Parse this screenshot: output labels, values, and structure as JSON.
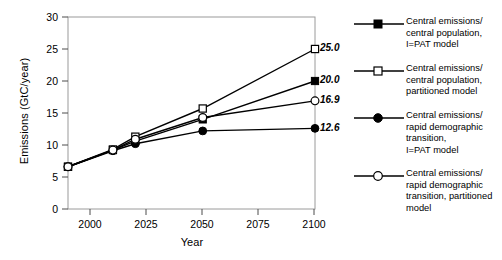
{
  "chart_data": {
    "type": "line",
    "title": "",
    "xlabel": "Year",
    "ylabel": "Emissions (GtC/year)",
    "xlim": [
      1990,
      2100
    ],
    "ylim": [
      0,
      30
    ],
    "xticks": [
      2000,
      2025,
      2050,
      2075,
      2100
    ],
    "yticks": [
      0,
      5,
      10,
      15,
      20,
      25,
      30
    ],
    "grid": false,
    "legend_position": "right",
    "x": [
      1990,
      2010,
      2020,
      2050,
      2100
    ],
    "series": [
      {
        "name": "Central emissions/\ncentral population,\nI=PAT model",
        "marker": "filled-square",
        "values": [
          6.6,
          9.2,
          10.6,
          14.0,
          20.0
        ],
        "endpoint_label": "20.0"
      },
      {
        "name": "Central emissions/\ncentral population,\npartitioned model",
        "marker": "open-square",
        "values": [
          6.6,
          9.3,
          11.3,
          15.7,
          25.0
        ],
        "endpoint_label": "25.0"
      },
      {
        "name": "Central emissions/\nrapid demographic\ntransition,\nI=PAT model",
        "marker": "filled-circle",
        "values": [
          6.6,
          9.1,
          10.2,
          12.2,
          12.6
        ],
        "endpoint_label": "12.6"
      },
      {
        "name": "Central emissions/\nrapid demographic\ntransition, partitioned\nmodel",
        "marker": "open-circle",
        "values": [
          6.6,
          9.2,
          10.9,
          14.3,
          16.9
        ],
        "endpoint_label": "16.9"
      }
    ]
  },
  "axes": {
    "y_title": "Emissions (GtC/year)",
    "x_title": "Year",
    "y_tick_labels": [
      "30",
      "25",
      "20",
      "15",
      "10",
      "5",
      "0"
    ],
    "x_tick_labels": [
      "2000",
      "2025",
      "2050",
      "2075",
      "2100"
    ]
  },
  "endpoint_labels": [
    {
      "value": "25.0"
    },
    {
      "value": "20.0"
    },
    {
      "value": "16.9"
    },
    {
      "value": "12.6"
    }
  ],
  "legend": {
    "items": [
      {
        "label": "Central emissions/\ncentral population,\nI=PAT model",
        "marker": "filled-square"
      },
      {
        "label": "Central emissions/\ncentral population,\npartitioned model",
        "marker": "open-square"
      },
      {
        "label": "Central emissions/\nrapid demographic\ntransition,\nI=PAT model",
        "marker": "filled-circle"
      },
      {
        "label": "Central emissions/\nrapid demographic\ntransition, partitioned\nmodel",
        "marker": "open-circle"
      }
    ]
  },
  "colors": {
    "line": "#000000",
    "frame": "#9a9a9a",
    "text": "#000000",
    "background": "#ffffff"
  }
}
